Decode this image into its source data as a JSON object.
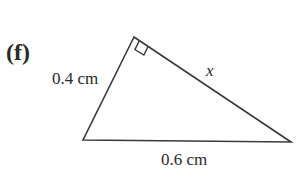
{
  "figure": {
    "part_label": "(f)",
    "sides": {
      "left": "0.4 cm",
      "bottom": "0.6 cm",
      "hypotenuse_unknown": "x"
    },
    "right_angle_marker": "top-vertex",
    "colors": {
      "stroke": "#3a3a3a",
      "text": "#2a2a2a"
    }
  }
}
